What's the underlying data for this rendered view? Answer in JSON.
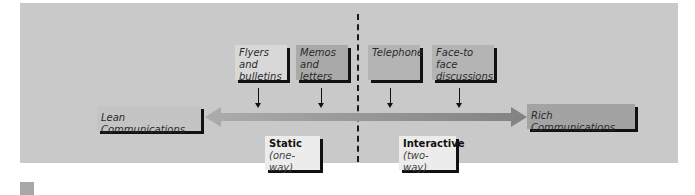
{
  "diagram": {
    "media_top": [
      {
        "label": "Flyers and\nbulletins",
        "line1": "Flyers and",
        "line2": "bulletins"
      },
      {
        "label": "Memos\nand letters",
        "line1": "Memos",
        "line2": "and letters"
      },
      {
        "label": "Telephone",
        "line1": "Telephone",
        "line2": ""
      },
      {
        "label": "Face-to face\ndiscussions",
        "line1": "Face-to face",
        "line2": "discussions"
      }
    ],
    "axis": {
      "left_label": "Lean Communications",
      "right_label": "Rich Communications"
    },
    "modes": [
      {
        "title": "Static",
        "subtitle": "(one-way)"
      },
      {
        "title": "Interactive",
        "subtitle": "(two-way)"
      }
    ],
    "colors": {
      "panel": "#c9c9c9",
      "box_light": "#dcdcdc",
      "box_mid": "#b5b5b5",
      "box_dark": "#a0a0a0",
      "mode_box": "#ececec",
      "shadow": "#111111",
      "arrow_light": "#a9a9a9",
      "arrow_dark": "#858585"
    }
  }
}
